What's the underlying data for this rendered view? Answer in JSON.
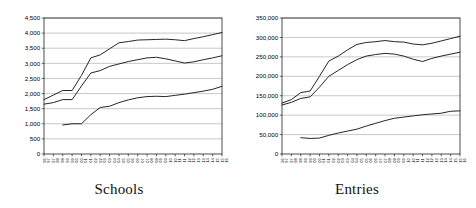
{
  "figure": {
    "panels": [
      {
        "caption": "Schools"
      },
      {
        "caption": "Entries"
      }
    ]
  },
  "chart_data": [
    {
      "type": "line",
      "title": "Schools",
      "xlabel": "",
      "ylabel": "",
      "grid": true,
      "legend": "none",
      "ylim": [
        0,
        4500
      ],
      "yticks": [
        0,
        500,
        1000,
        1500,
        2000,
        2500,
        3000,
        3500,
        4000,
        4500
      ],
      "ytick_labels": [
        "0",
        "500",
        "1,000",
        "1,500",
        "2,000",
        "2,500",
        "3,000",
        "3,500",
        "4,000",
        "4,500"
      ],
      "categories": [
        "96/97",
        "97/98",
        "98/99",
        "99/00",
        "00/01",
        "01/02",
        "02/03",
        "03/04",
        "04/05",
        "05/06",
        "06/07",
        "07/08",
        "08/09",
        "09/10",
        "10/11",
        "11/12",
        "12/13",
        "13/14",
        "14/15",
        "15/16"
      ],
      "series": [
        {
          "name": "upper",
          "values": [
            1800,
            1950,
            2100,
            2100,
            2600,
            3180,
            3280,
            3480,
            3680,
            3720,
            3770,
            3780,
            3790,
            3800,
            3780,
            3750,
            3820,
            3880,
            3950,
            4020
          ]
        },
        {
          "name": "middle",
          "values": [
            1650,
            1700,
            1800,
            1800,
            2250,
            2680,
            2760,
            2900,
            2980,
            3060,
            3120,
            3180,
            3200,
            3150,
            3080,
            3010,
            3050,
            3120,
            3180,
            3250
          ]
        },
        {
          "name": "lower",
          "values": [
            null,
            null,
            960,
            1000,
            1000,
            1300,
            1540,
            1580,
            1700,
            1790,
            1860,
            1900,
            1910,
            1900,
            1940,
            1980,
            2030,
            2080,
            2140,
            2240
          ]
        }
      ]
    },
    {
      "type": "line",
      "title": "Entries",
      "xlabel": "",
      "ylabel": "",
      "grid": true,
      "legend": "none",
      "ylim": [
        0,
        350000
      ],
      "yticks": [
        0,
        50000,
        100000,
        150000,
        200000,
        250000,
        300000,
        350000
      ],
      "ytick_labels": [
        "0",
        "50,000",
        "100,000",
        "150,000",
        "200,000",
        "250,000",
        "300,000",
        "350,000"
      ],
      "categories": [
        "96/97",
        "97/98",
        "98/99",
        "99/00",
        "00/01",
        "01/02",
        "02/03",
        "03/04",
        "04/05",
        "05/06",
        "06/07",
        "07/08",
        "08/09",
        "09/10",
        "10/11",
        "11/12",
        "12/13",
        "13/14",
        "14/15",
        "15/16"
      ],
      "series": [
        {
          "name": "upper",
          "values": [
            131000,
            140000,
            158000,
            162000,
            200000,
            239000,
            252000,
            268000,
            282000,
            287000,
            289000,
            292000,
            289000,
            288000,
            283000,
            281000,
            285000,
            291000,
            297000,
            303000
          ]
        },
        {
          "name": "middle",
          "values": [
            126000,
            133000,
            143000,
            147000,
            172000,
            200000,
            215000,
            230000,
            243000,
            252000,
            256000,
            259000,
            257000,
            252000,
            244000,
            238000,
            246000,
            252000,
            257000,
            262000
          ]
        },
        {
          "name": "lower",
          "values": [
            null,
            null,
            42000,
            40000,
            41000,
            48000,
            54000,
            59000,
            64000,
            72000,
            79000,
            86000,
            92000,
            95000,
            98000,
            101000,
            103000,
            105000,
            110000,
            111000
          ]
        }
      ]
    }
  ]
}
